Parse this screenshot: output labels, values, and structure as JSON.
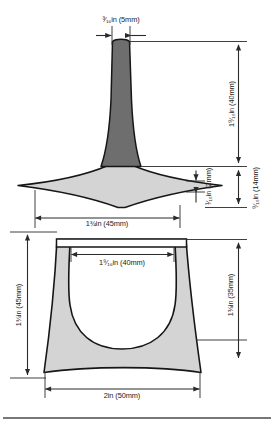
{
  "drawing": {
    "title": "Stemmed form pattern - dimensioned drawing",
    "units_note": "Dimensions given in inches with millimetre equivalents",
    "colors": {
      "stem_fill": "#6e6e6e",
      "body_fill": "#d4d4d4",
      "outline": "#161616",
      "dimension_line": "#2a2a2a",
      "footer_rule": "#4a4a4a",
      "background": "#ffffff"
    },
    "views": [
      {
        "name": "side-elevation",
        "description": "Tapered stem widening into a flared lens-shaped foot"
      },
      {
        "name": "front-elevation",
        "description": "Flared body with flat top rail and deep U-shaped cut-out"
      }
    ]
  },
  "dimensions": {
    "stem_width": {
      "label": "³⁄₁₆in (5mm)",
      "imperial": "3/16in",
      "metric": "5mm",
      "orientation": "horizontal",
      "applies_to": "stem-width"
    },
    "stem_height": {
      "label": "1⁹⁄₁₆in (40mm)",
      "imperial": "1 9/16in",
      "metric": "40mm",
      "orientation": "vertical",
      "applies_to": "stem-height"
    },
    "foot_edge_thickness": {
      "label": "¹⁄₁₆in (2mm)",
      "imperial": "1/16in",
      "metric": "2mm",
      "orientation": "vertical",
      "applies_to": "foot-edge-thickness"
    },
    "foot_height": {
      "label": "⁹⁄₁₆in (14mm)",
      "imperial": "9/16in",
      "metric": "14mm",
      "orientation": "vertical",
      "applies_to": "foot-height"
    },
    "foot_width": {
      "label": "1¾in (45mm)",
      "imperial": "1 3/4in",
      "metric": "45mm",
      "orientation": "horizontal",
      "applies_to": "foot-width"
    },
    "opening_width": {
      "label": "1⁹⁄₁₆in (40mm)",
      "imperial": "1 9/16in",
      "metric": "40mm",
      "orientation": "horizontal",
      "applies_to": "body-opening-width"
    },
    "body_height_left": {
      "label": "1¾in (45mm)",
      "imperial": "1 3/4in",
      "metric": "45mm",
      "orientation": "vertical",
      "applies_to": "body-overall-height"
    },
    "body_height_right": {
      "label": "1⅜in (35mm)",
      "imperial": "1 3/8in",
      "metric": "35mm",
      "orientation": "vertical",
      "applies_to": "body-side-height"
    },
    "base_width": {
      "label": "2in (50mm)",
      "imperial": "2in",
      "metric": "50mm",
      "orientation": "horizontal",
      "applies_to": "body-base-width"
    }
  }
}
